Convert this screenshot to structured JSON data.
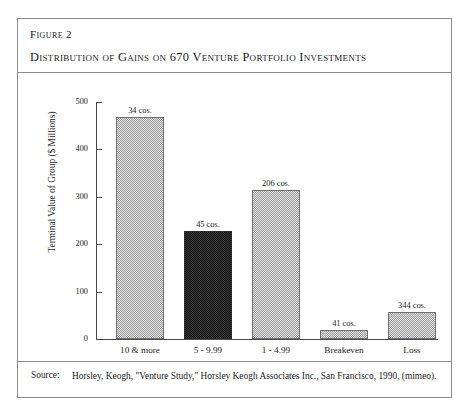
{
  "figure": {
    "number": "Figure 2",
    "title": "Distribution of Gains on 670 Venture Portfolio Investments"
  },
  "source": {
    "label": "Source:",
    "text": "Horsley, Keogh, \"Venture Study,\" Horsley Keogh Associates Inc., San Francisco, 1990, (mimeo)."
  },
  "colors": {
    "light_bar": "#e4e4e4",
    "dark_bar": "#3b3b3b",
    "border": "#8c8c8c",
    "axis": "#4a4a4a",
    "text": "#1b1b1b"
  },
  "chart_data": {
    "type": "bar",
    "title": "Distribution of Gains on 670 Venture Portfolio Investments",
    "xlabel": "",
    "ylabel": "Terminal Value of Group ($ Millions)",
    "ylim": [
      0,
      500
    ],
    "yticks": [
      0,
      100,
      200,
      300,
      400,
      500
    ],
    "ytick_labels": [
      "0",
      "100",
      "200",
      "300",
      "400",
      "500"
    ],
    "grid": false,
    "legend": "none",
    "categories": [
      "10 & more",
      "5 - 9.99",
      "1 - 4.99",
      "Breakeven",
      "Loss"
    ],
    "values": [
      468,
      228,
      315,
      20,
      57
    ],
    "data_labels": [
      "34 cos.",
      "45 cos.",
      "206 cos.",
      "41 cos.",
      "344 cos."
    ],
    "companies": [
      34,
      45,
      206,
      41,
      344
    ],
    "bar_styles": [
      "light",
      "dark",
      "light",
      "light",
      "light"
    ]
  }
}
